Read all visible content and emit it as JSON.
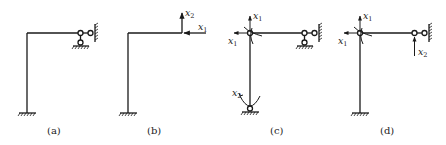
{
  "figure": {
    "panels": [
      {
        "id": "a",
        "caption": "(a)",
        "description": "Original portal frame: fixed column base, beam right end with pin connected to horizontal roller (wall) and vertical roller (ground)"
      },
      {
        "id": "b",
        "caption": "(b)",
        "description": "Basic structure: cantilever frame with redundant forces at beam end",
        "unknowns": [
          {
            "name": "x",
            "sub": "1",
            "type": "horizontal force, leftward"
          },
          {
            "name": "x",
            "sub": "2",
            "type": "vertical force, upward"
          }
        ]
      },
      {
        "id": "c",
        "caption": "(c)",
        "description": "Basic structure with hinge at joint and hinge at column base; pair of unknowns at joint and at base",
        "unknowns": [
          {
            "name": "x",
            "sub": "1",
            "type": "force pair / moment at joint"
          },
          {
            "name": "x",
            "sub": "1",
            "type": "horizontal at joint"
          },
          {
            "name": "x",
            "sub": "2",
            "type": "moment at base hinge"
          }
        ]
      },
      {
        "id": "d",
        "caption": "(d)",
        "description": "Basic structure with hinge at joint and vertical redundant at beam end; horizontal roller remains",
        "unknowns": [
          {
            "name": "x",
            "sub": "1",
            "type": "force pair / moment at joint"
          },
          {
            "name": "x",
            "sub": "1",
            "type": "horizontal at joint"
          },
          {
            "name": "x",
            "sub": "2",
            "type": "vertical force, upward at beam end"
          }
        ]
      }
    ]
  },
  "labels": {
    "a": "(a)",
    "b": "(b)",
    "c": "(c)",
    "d": "(d)",
    "x": "x",
    "s1": "1",
    "s2": "2"
  },
  "colors": {
    "line": "#1a1a1a",
    "background": "#ffffff"
  }
}
